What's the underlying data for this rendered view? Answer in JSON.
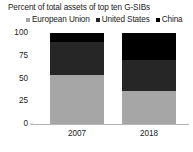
{
  "chart_data": {
    "type": "bar",
    "subtype": "stacked-column-100",
    "title": "Percent of total assets of top ten G-SIBs",
    "xlabel": "",
    "ylabel": "",
    "categories": [
      "2007",
      "2018"
    ],
    "series": [
      {
        "name": "European Union",
        "values": [
          54,
          36
        ],
        "color": "#a6a6a6"
      },
      {
        "name": "United States",
        "values": [
          36,
          34
        ],
        "color": "#262626"
      },
      {
        "name": "China",
        "values": [
          10,
          30
        ],
        "color": "#000000"
      }
    ],
    "ylim": [
      0,
      100
    ],
    "yticks": [
      0,
      25,
      50,
      75,
      100
    ],
    "ytick_labels": [
      "0",
      "25",
      "50",
      "75",
      "100"
    ],
    "grid": false,
    "legend_position": "top"
  },
  "legend": {
    "entries": [
      {
        "label": "European Union",
        "marker": "square-swatch-icon",
        "color": "#a6a6a6"
      },
      {
        "label": "United States",
        "marker": "square-swatch-icon",
        "color": "#262626"
      },
      {
        "label": "China",
        "marker": "square-swatch-icon",
        "color": "#000000"
      }
    ]
  },
  "axes": {
    "y": {
      "ticks": [
        "100",
        "75",
        "50",
        "25",
        "0"
      ]
    },
    "x": {
      "labels": [
        "2007",
        "2018"
      ]
    }
  }
}
